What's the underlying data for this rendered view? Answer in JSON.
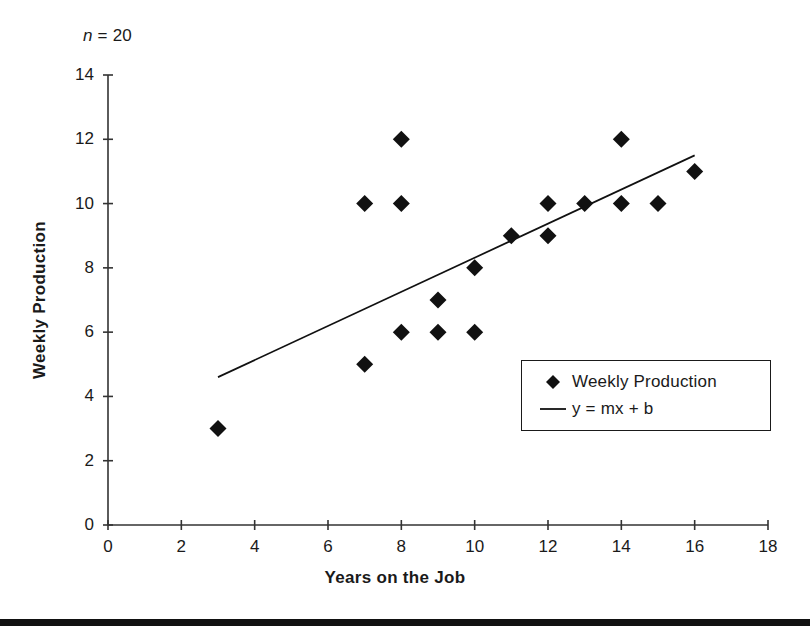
{
  "figure": {
    "annotation_n": "n = 20",
    "annotation_n_symbol": "n",
    "annotation_n_value": "= 20"
  },
  "legend": {
    "entries": [
      {
        "label": "Weekly Production",
        "marker": "diamond",
        "color": "#111111"
      },
      {
        "label": "y = mx + b",
        "marker": "line",
        "color": "#111111"
      }
    ]
  },
  "chart_data": {
    "type": "scatter",
    "title": "",
    "xlabel": "Years on the Job",
    "ylabel": "Weekly Production",
    "xlim": [
      0,
      18
    ],
    "ylim": [
      0,
      14
    ],
    "xticks": [
      0,
      2,
      4,
      6,
      8,
      10,
      12,
      14,
      16,
      18
    ],
    "yticks": [
      0,
      2,
      4,
      6,
      8,
      10,
      12,
      14
    ],
    "grid": false,
    "legend_position": "lower-right",
    "annotation": "n = 20",
    "series": [
      {
        "name": "Weekly Production",
        "marker": "diamond",
        "color": "#111111",
        "points": [
          {
            "x": 3,
            "y": 3
          },
          {
            "x": 7,
            "y": 10
          },
          {
            "x": 7,
            "y": 5
          },
          {
            "x": 8,
            "y": 12
          },
          {
            "x": 8,
            "y": 10
          },
          {
            "x": 8,
            "y": 6
          },
          {
            "x": 9,
            "y": 7
          },
          {
            "x": 9,
            "y": 6
          },
          {
            "x": 10,
            "y": 8
          },
          {
            "x": 10,
            "y": 6
          },
          {
            "x": 11,
            "y": 9
          },
          {
            "x": 12,
            "y": 10
          },
          {
            "x": 12,
            "y": 9
          },
          {
            "x": 13,
            "y": 10
          },
          {
            "x": 14,
            "y": 12
          },
          {
            "x": 14,
            "y": 10
          },
          {
            "x": 15,
            "y": 10
          },
          {
            "x": 16,
            "y": 11
          }
        ]
      },
      {
        "name": "y = mx + b",
        "type": "line",
        "color": "#111111",
        "endpoints": [
          {
            "x": 3,
            "y": 4.6
          },
          {
            "x": 16,
            "y": 11.5
          }
        ]
      }
    ]
  }
}
